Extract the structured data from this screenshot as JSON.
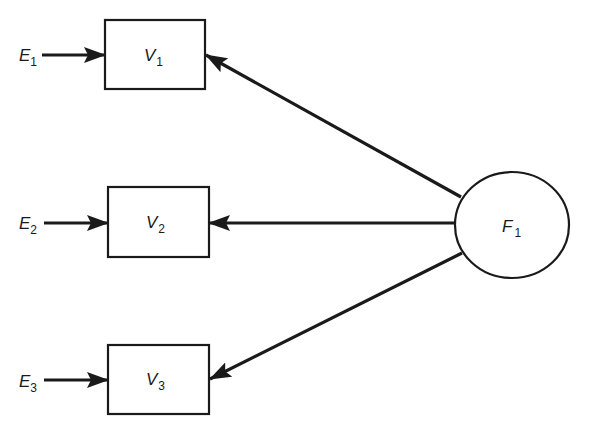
{
  "diagram": {
    "type": "factor-model-path-diagram",
    "factor": {
      "id": "F1",
      "letter": "F",
      "subscript": "1",
      "shape": "ellipse"
    },
    "observed": [
      {
        "id": "V1",
        "letter": "V",
        "subscript": "1",
        "shape": "rectangle"
      },
      {
        "id": "V2",
        "letter": "V",
        "subscript": "2",
        "shape": "rectangle"
      },
      {
        "id": "V3",
        "letter": "V",
        "subscript": "3",
        "shape": "rectangle"
      }
    ],
    "errors": [
      {
        "id": "E1",
        "letter": "E",
        "subscript": "1",
        "target": "V1"
      },
      {
        "id": "E2",
        "letter": "E",
        "subscript": "2",
        "target": "V2"
      },
      {
        "id": "E3",
        "letter": "E",
        "subscript": "3",
        "target": "V3"
      }
    ],
    "edges": [
      {
        "from": "E1",
        "to": "V1"
      },
      {
        "from": "E2",
        "to": "V2"
      },
      {
        "from": "E3",
        "to": "V3"
      },
      {
        "from": "F1",
        "to": "V1"
      },
      {
        "from": "F1",
        "to": "V2"
      },
      {
        "from": "F1",
        "to": "V3"
      }
    ],
    "colors": {
      "stroke": "#1a1a1a",
      "background": "#ffffff"
    }
  }
}
